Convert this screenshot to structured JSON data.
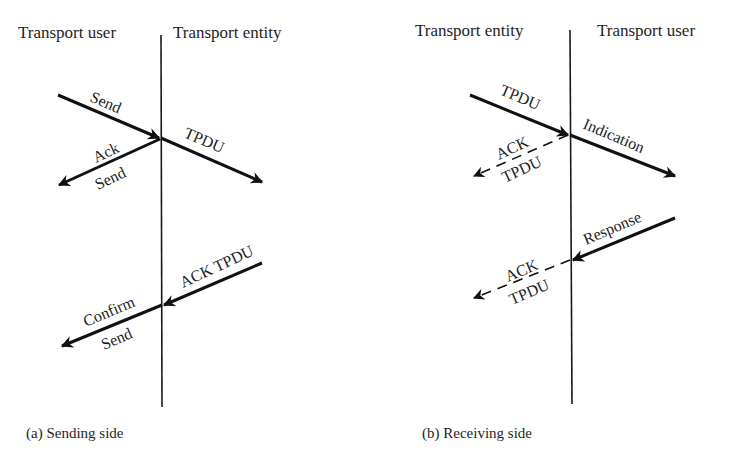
{
  "panels": [
    {
      "id": "a",
      "left_header": "Transport user",
      "right_header": "Transport entity",
      "caption": "(a)  Sending side",
      "arrows": [
        {
          "label": "Send",
          "style": "solid"
        },
        {
          "label": "TPDU",
          "style": "solid"
        },
        {
          "label_top": "Ack",
          "label_bottom": "Send",
          "style": "solid"
        },
        {
          "label": "ACK TPDU",
          "style": "solid"
        },
        {
          "label_top": "Confirm",
          "label_bottom": "Send",
          "style": "solid"
        }
      ]
    },
    {
      "id": "b",
      "left_header": "Transport entity",
      "right_header": "Transport user",
      "caption": "(b)  Receiving side",
      "arrows": [
        {
          "label": "TPDU",
          "style": "solid"
        },
        {
          "label": "Indication",
          "style": "solid"
        },
        {
          "label_top": "ACK",
          "label_bottom": "TPDU",
          "style": "dashed"
        },
        {
          "label": "Response",
          "style": "solid"
        },
        {
          "label_top": "ACK",
          "label_bottom": "TPDU",
          "style": "dashed"
        }
      ]
    }
  ]
}
